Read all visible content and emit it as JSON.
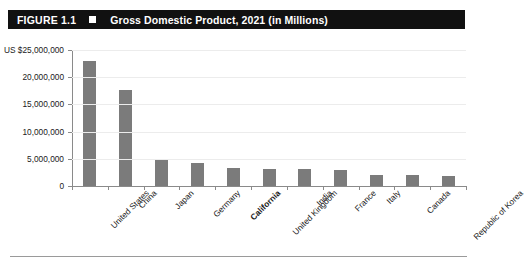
{
  "header": {
    "figure_number": "FIGURE 1.1",
    "square_marker": "white-square-marker",
    "title": "Gross Domestic Product, 2021 (in Millions)"
  },
  "chart_data": {
    "type": "bar",
    "title": "Gross Domestic Product, 2021 (in Millions)",
    "xlabel": "",
    "ylabel": "",
    "ylim": [
      0,
      25000000
    ],
    "grid": true,
    "legend": "none",
    "axis_unit_prefix": "US $",
    "highlighted_category": "California",
    "categories": [
      "United States",
      "China",
      "Japan",
      "Germany",
      "California",
      "United Kingdom",
      "India",
      "France",
      "Italy",
      "Canada",
      "Republic of Korea"
    ],
    "values": [
      23000000,
      17700000,
      4900000,
      4200000,
      3400000,
      3100000,
      3050000,
      2900000,
      2100000,
      2000000,
      1800000
    ],
    "yticks": [
      {
        "value": 25000000,
        "label": "US $25,000,000"
      },
      {
        "value": 20000000,
        "label": "20,000,000"
      },
      {
        "value": 15000000,
        "label": "15,000,000"
      },
      {
        "value": 10000000,
        "label": "10,000,000"
      },
      {
        "value": 5000000,
        "label": "5,000,000"
      },
      {
        "value": 0,
        "label": "0"
      }
    ],
    "colors": {
      "bar": "#7b7b7b",
      "axis": "#8a8a8a",
      "grid": "#ececec",
      "titlebar_bg": "#111111",
      "titlebar_text": "#ffffff"
    }
  }
}
